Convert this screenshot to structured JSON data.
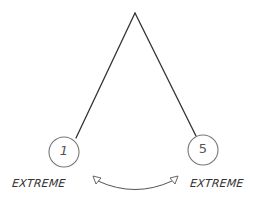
{
  "diagram": {
    "type": "hand-drawn scale diagram",
    "apex": {
      "x": 135,
      "y": 13
    },
    "nodes": [
      {
        "id": "left",
        "label": "1",
        "cx": 64,
        "cy": 152,
        "r": 15
      },
      {
        "id": "right",
        "label": "5",
        "cx": 203,
        "cy": 150,
        "r": 15
      }
    ],
    "labels": {
      "left_extreme": "EXTREME",
      "right_extreme": "EXTREME"
    },
    "arrow": {
      "type": "double-headed curved arrow",
      "from": {
        "x": 94,
        "y": 178
      },
      "to": {
        "x": 175,
        "y": 178
      }
    },
    "colors": {
      "stroke": "#333333",
      "circle_stroke": "#777777",
      "background": "#ffffff"
    }
  }
}
